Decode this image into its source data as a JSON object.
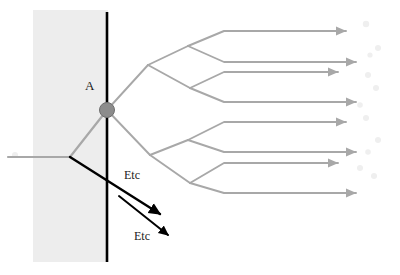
{
  "figure": {
    "type": "ray-diagram",
    "width": 400,
    "height": 275,
    "background_color": "#ffffff",
    "shaded_region": {
      "name": "medium-shading",
      "x": 33,
      "y": 10,
      "width": 75,
      "height": 252,
      "color": "#ededed"
    },
    "boundary_line": {
      "name": "interface-line",
      "x": 107,
      "y1": 12,
      "y2": 262,
      "color": "#000000",
      "width": 2.6
    },
    "node": {
      "label": "A",
      "x": 107,
      "y": 110,
      "radius": 7.5,
      "color": "#8c8c8c",
      "stroke": "#6e6e6e"
    },
    "colors": {
      "ray_gray": "#a8a8a8",
      "ray_gray_faint": "#bdbdbd",
      "arrow_black": "#000000",
      "node_gray": "#8c8c8c",
      "shade_gray": "#ededed",
      "text": "#1a1a1a"
    }
  },
  "labels": {
    "node_label": "A",
    "etc_upper": "Etc",
    "etc_lower": "Etc"
  },
  "rays": {
    "incident": {
      "name": "incident-ray",
      "points": [
        [
          8,
          157
        ],
        [
          70,
          157
        ]
      ],
      "color": "#a8a8a8"
    },
    "to_node": {
      "name": "ray-to-node-A",
      "points": [
        [
          70,
          157
        ],
        [
          107,
          110
        ]
      ],
      "color": "#a8a8a8"
    },
    "reflected_black": {
      "name": "reflected-ray-arrow",
      "points": [
        [
          70,
          157
        ],
        [
          160,
          214
        ]
      ],
      "color": "#000000",
      "arrowhead": true
    },
    "transmitted_black": {
      "name": "transmitted-ray-arrow",
      "points": [
        [
          119,
          196
        ],
        [
          168,
          235
        ]
      ],
      "color": "#000000",
      "arrowhead": true
    }
  },
  "tree": {
    "name": "ray-branching-tree",
    "root": [
      107,
      110
    ],
    "level1_nodes": [
      [
        148,
        65
      ],
      [
        150,
        155
      ]
    ],
    "level2_nodes": [
      [
        188,
        46
      ],
      [
        190,
        88
      ],
      [
        188,
        140
      ],
      [
        190,
        183
      ]
    ],
    "branch_color": "#a8a8a8",
    "leaves": [
      {
        "name": "outgoing-ray-1",
        "start": [
          188,
          46
        ],
        "bend": [
          224,
          31
        ],
        "end": [
          346,
          31
        ]
      },
      {
        "name": "outgoing-ray-2",
        "start": [
          188,
          46
        ],
        "bend": [
          224,
          62
        ],
        "end": [
          356,
          62
        ]
      },
      {
        "name": "outgoing-ray-3",
        "start": [
          190,
          88
        ],
        "bend": [
          224,
          72
        ],
        "end": [
          338,
          72
        ]
      },
      {
        "name": "outgoing-ray-4",
        "start": [
          190,
          88
        ],
        "bend": [
          224,
          102
        ],
        "end": [
          356,
          102
        ]
      },
      {
        "name": "outgoing-ray-5",
        "start": [
          188,
          140
        ],
        "bend": [
          224,
          122
        ],
        "end": [
          346,
          122
        ]
      },
      {
        "name": "outgoing-ray-6",
        "start": [
          188,
          140
        ],
        "bend": [
          224,
          152
        ],
        "end": [
          356,
          152
        ]
      },
      {
        "name": "outgoing-ray-7",
        "start": [
          190,
          183
        ],
        "bend": [
          224,
          163
        ],
        "end": [
          338,
          163
        ]
      },
      {
        "name": "outgoing-ray-8",
        "start": [
          190,
          183
        ],
        "bend": [
          224,
          193
        ],
        "end": [
          356,
          193
        ]
      }
    ]
  },
  "faint_marks": {
    "name": "faint-artifact-marks",
    "color": "#efefef",
    "positions": [
      [
        15,
        155
      ],
      [
        366,
        24
      ],
      [
        378,
        48
      ],
      [
        370,
        55
      ],
      [
        368,
        75
      ],
      [
        376,
        88
      ],
      [
        360,
        105
      ],
      [
        366,
        118
      ],
      [
        378,
        140
      ],
      [
        368,
        152
      ],
      [
        360,
        168
      ],
      [
        374,
        176
      ]
    ]
  }
}
